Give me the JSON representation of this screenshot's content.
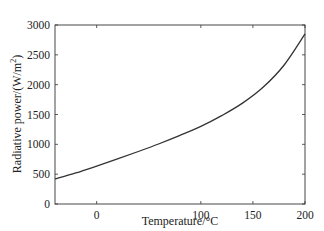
{
  "chart_data": {
    "type": "line",
    "title": "",
    "xlabel": "Temperature/°C",
    "ylabel": "Radiative power/(W/m²)",
    "xlim": [
      -40,
      200
    ],
    "ylim": [
      0,
      3000
    ],
    "xticks": [
      0,
      100,
      150,
      200
    ],
    "yticks": [
      0,
      500,
      1000,
      1500,
      2000,
      2500,
      3000
    ],
    "grid": false,
    "legend": null,
    "series": [
      {
        "name": "Radiative power",
        "color": "#333333",
        "x": [
          -40,
          -20,
          0,
          20,
          40,
          60,
          80,
          100,
          120,
          140,
          160,
          180,
          200
        ],
        "y": [
          420,
          520,
          635,
          755,
          880,
          1010,
          1150,
          1300,
          1480,
          1690,
          1960,
          2330,
          2850
        ]
      }
    ]
  }
}
